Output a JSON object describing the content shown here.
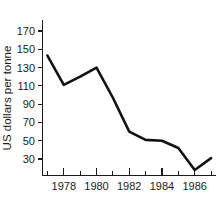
{
  "chart_data": {
    "type": "line",
    "title": "",
    "subtitle": "",
    "xlabel": "",
    "ylabel": "US dollars per tonne",
    "x": [
      1977,
      1978,
      1979,
      1980,
      1981,
      1982,
      1983,
      1984,
      1985,
      1986,
      1987
    ],
    "values": [
      143,
      111,
      120,
      130,
      97,
      60,
      51,
      50,
      42,
      18,
      31
    ],
    "series": [
      {
        "name": "Price",
        "values": [
          143,
          111,
          120,
          130,
          97,
          60,
          51,
          50,
          42,
          18,
          31
        ]
      }
    ],
    "xlim": [
      1976.7,
      1987.3
    ],
    "ylim": [
      12,
      182
    ],
    "xticks": [
      1978,
      1980,
      1982,
      1984,
      1986
    ],
    "xtick_labels": [
      "1978",
      "1980",
      "1982",
      "1984",
      "1986"
    ],
    "xticks_minor": [
      1977,
      1979,
      1981,
      1983,
      1985,
      1987
    ],
    "yticks": [
      30,
      50,
      70,
      90,
      110,
      130,
      150,
      170
    ],
    "ytick_labels": [
      "30",
      "50",
      "70",
      "90",
      "110",
      "130",
      "150",
      "170"
    ],
    "grid": false,
    "legend": false,
    "legend_position": "none",
    "line_color": "#111111",
    "axis_color": "#1a1a1a",
    "background_color": "#ffffff"
  }
}
